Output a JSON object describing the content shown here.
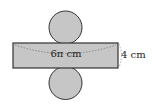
{
  "diagram": {
    "type": "cylinder-net",
    "shapes": {
      "top_circle": {
        "cx": 65.5,
        "cy": 27.5,
        "r": 16.5
      },
      "bottom_circle": {
        "cx": 65.5,
        "cy": 83,
        "r": 16.5
      },
      "rectangle": {
        "x": 13,
        "y": 43,
        "width": 105,
        "height": 25
      }
    },
    "labels": {
      "length": "6π cm",
      "height": "4 cm"
    },
    "colors": {
      "fill": "#c6c6c6",
      "stroke": "#333333",
      "dotted": "#777777"
    }
  }
}
